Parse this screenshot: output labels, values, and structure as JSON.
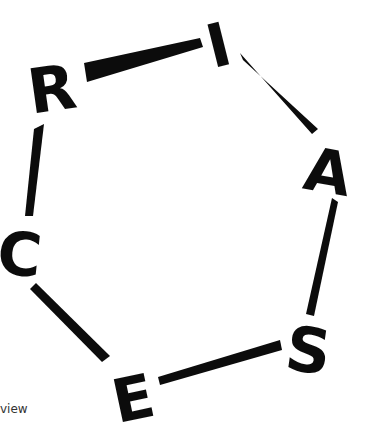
{
  "logo": {
    "letters": [
      "R",
      "I",
      "A",
      "S",
      "E",
      "C"
    ],
    "color": "#0c0c0c"
  },
  "caption": "view"
}
